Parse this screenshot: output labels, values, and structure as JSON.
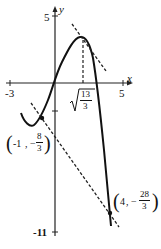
{
  "diagram": {
    "type": "function-graph",
    "axes": {
      "x_label": "x",
      "y_label": "y",
      "x_ticks": [
        "-3",
        "5"
      ],
      "y_ticks": [
        "5",
        "-11"
      ]
    },
    "annotations": {
      "vertex_x_label": "√(13/3)",
      "vertex_x_num": "13",
      "vertex_x_den": "3",
      "point_a": {
        "label": "(-1, -8/3)",
        "x": "-1",
        "num": "8",
        "den": "3"
      },
      "point_b": {
        "label": "(4, -28/3)",
        "x": "4",
        "num": "28",
        "den": "3"
      }
    },
    "colors": {
      "curve": "#111111",
      "axis": "#222222",
      "dashed": "#222222"
    }
  }
}
